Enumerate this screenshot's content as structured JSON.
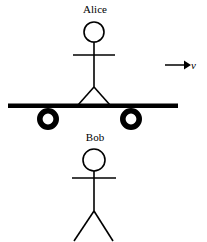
{
  "figure": {
    "background_color": "#ffffff",
    "stroke_color": "#000000",
    "width": 207,
    "height": 242
  },
  "labels": {
    "alice": "Alice",
    "bob": "Bob",
    "velocity": "v"
  },
  "annotations": {
    "velocity_arrow": {
      "name": "velocity-arrow",
      "direction": "right",
      "x1": 165,
      "y1": 65,
      "x2": 190,
      "y2": 65
    }
  },
  "figures": {
    "alice": {
      "name": "alice-stick-figure",
      "head": {
        "cx": 94,
        "cy": 32,
        "r": 10
      },
      "neck": {
        "x1": 94,
        "y1": 42,
        "x2": 94,
        "y2": 87
      },
      "arms": {
        "x1": 73,
        "y1": 55,
        "x2": 115,
        "y2": 55
      },
      "leg_left": {
        "x1": 94,
        "y1": 87,
        "x2": 78,
        "y2": 105
      },
      "leg_right": {
        "x1": 94,
        "y1": 87,
        "x2": 110,
        "y2": 105
      }
    },
    "bob": {
      "name": "bob-stick-figure",
      "head": {
        "cx": 94,
        "cy": 160,
        "r": 11
      },
      "neck": {
        "x1": 94,
        "y1": 171,
        "x2": 94,
        "y2": 211
      },
      "arms": {
        "x1": 72,
        "y1": 178,
        "x2": 116,
        "y2": 178
      },
      "leg_left": {
        "x1": 94,
        "y1": 211,
        "x2": 74,
        "y2": 240
      },
      "leg_right": {
        "x1": 94,
        "y1": 211,
        "x2": 113,
        "y2": 240
      }
    }
  },
  "cart": {
    "name": "rolling-cart",
    "platform": {
      "x": 8,
      "y": 104,
      "width": 170,
      "height": 4
    },
    "wheels": [
      {
        "name": "cart-wheel-left",
        "cx": 48,
        "cy": 119,
        "r_outer": 11,
        "r_inner": 5.5
      },
      {
        "name": "cart-wheel-right",
        "cx": 131,
        "cy": 119,
        "r_outer": 11,
        "r_inner": 5.5
      }
    ]
  },
  "colors": {
    "ink": "#000000",
    "paper": "#ffffff"
  }
}
